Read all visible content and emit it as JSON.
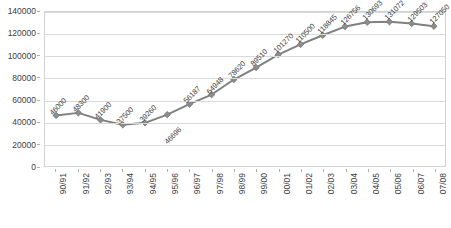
{
  "chart_data": {
    "type": "line",
    "title": "",
    "xlabel": "",
    "ylabel": "",
    "categories": [
      "90/91",
      "91/92",
      "92/93",
      "93/94",
      "94/95",
      "95/96",
      "96/97",
      "97/98",
      "98/99",
      "99/00",
      "00/01",
      "01/02",
      "02/03",
      "03/04",
      "04/05",
      "05/06",
      "06/07",
      "07/08"
    ],
    "values": [
      46000,
      48300,
      41900,
      37500,
      39260,
      46696,
      56187,
      64948,
      78620,
      89510,
      101270,
      110500,
      118845,
      126756,
      130693,
      131072,
      129503,
      127050
    ],
    "data_labels": [
      "46000",
      "48300",
      "41900",
      "37500",
      "39260",
      "46696",
      "56187",
      "64948",
      "78620",
      "89510",
      "101270",
      "110500",
      "118845",
      "126756",
      "130693",
      "131072",
      "129503",
      "127050"
    ],
    "ylim": [
      0,
      140000
    ],
    "ytick_values": [
      0,
      20000,
      40000,
      60000,
      80000,
      100000,
      120000,
      140000
    ],
    "ytick_labels": [
      "0",
      "20000",
      "40000",
      "60000",
      "80000",
      "100000",
      "120000",
      "140000"
    ],
    "grid": true,
    "legend": "none",
    "series_color": "#808080",
    "marker_color": "#8c8c8c",
    "gridline_color": "#d9d9d9",
    "plot_border_color": "#d2d2d2",
    "text_color": "#404040",
    "marker": "diamond",
    "label_rotation_deg": -45,
    "xtick_rotation_deg": -90
  }
}
